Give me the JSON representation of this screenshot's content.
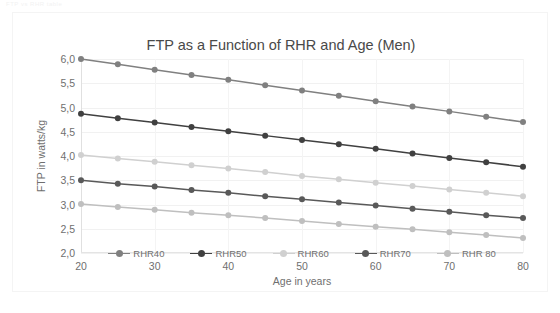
{
  "document": {
    "header_text": "FTP vs RHR table"
  },
  "chart_data": {
    "type": "line",
    "title": "FTP as a Function of RHR and Age (Men)",
    "xlabel": "Age in years",
    "ylabel": "FTP in watts/kg",
    "x": [
      20,
      25,
      30,
      35,
      40,
      45,
      50,
      55,
      60,
      65,
      70,
      75,
      80
    ],
    "xlim": [
      20,
      80
    ],
    "ylim": [
      2.0,
      6.0
    ],
    "xticks": [
      "20",
      "30",
      "40",
      "50",
      "60",
      "70",
      "80"
    ],
    "xtick_values": [
      20,
      30,
      40,
      50,
      60,
      70,
      80
    ],
    "yticks": [
      "2,0",
      "2,5",
      "3,0",
      "3,5",
      "4,0",
      "4,5",
      "5,0",
      "5,5",
      "6,0"
    ],
    "ytick_values": [
      2.0,
      2.5,
      3.0,
      3.5,
      4.0,
      4.5,
      5.0,
      5.5,
      6.0
    ],
    "grid": true,
    "legend_position": "bottom",
    "markers": "circle",
    "series": [
      {
        "name": "RHR40",
        "color": "#808080",
        "values": [
          6.0,
          5.89,
          5.78,
          5.67,
          5.57,
          5.46,
          5.35,
          5.24,
          5.13,
          5.02,
          4.92,
          4.81,
          4.7
        ]
      },
      {
        "name": "RHR50",
        "color": "#404040",
        "values": [
          4.87,
          4.78,
          4.69,
          4.6,
          4.51,
          4.42,
          4.33,
          4.24,
          4.15,
          4.05,
          3.96,
          3.87,
          3.78
        ]
      },
      {
        "name": "RHR60",
        "color": "#d0d0d0",
        "values": [
          4.02,
          3.95,
          3.88,
          3.81,
          3.74,
          3.67,
          3.59,
          3.52,
          3.45,
          3.38,
          3.31,
          3.24,
          3.17
        ]
      },
      {
        "name": "RHR70",
        "color": "#595959",
        "values": [
          3.5,
          3.43,
          3.37,
          3.3,
          3.24,
          3.17,
          3.11,
          3.04,
          2.98,
          2.91,
          2.85,
          2.78,
          2.72
        ]
      },
      {
        "name": "RHR 80",
        "color": "#bfbfbf",
        "values": [
          3.01,
          2.95,
          2.89,
          2.83,
          2.78,
          2.72,
          2.66,
          2.6,
          2.54,
          2.49,
          2.43,
          2.37,
          2.31
        ]
      }
    ]
  }
}
